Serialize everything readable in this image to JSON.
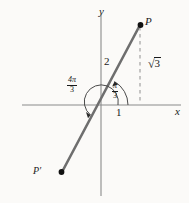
{
  "figure": {
    "background_color": "#fbfaf8",
    "ink_color": "#1a1a1a",
    "ray_color": "#6e6e6e",
    "axis_color": "#8a8a8a"
  },
  "axes": {
    "x_label": "x",
    "y_label": "y",
    "origin": {
      "x": 101,
      "y": 105
    }
  },
  "points": [
    {
      "name": "P",
      "label": "P",
      "x": 140,
      "y": 25
    },
    {
      "name": "P-prime",
      "label": "P′",
      "x": 62,
      "y": 172
    }
  ],
  "labels": {
    "radius": "2",
    "x_component": "1",
    "y_component_numerator": "3",
    "radical_sign": "√"
  },
  "angles": [
    {
      "name": "theta-minor",
      "numerator": "π",
      "denominator": "3",
      "value_text": "π/3"
    },
    {
      "name": "theta-major",
      "numerator": "4π",
      "denominator": "3",
      "value_text": "4π/3"
    }
  ],
  "geometry": {
    "dashed_line": {
      "x": 140,
      "y_top": 25,
      "y_bottom": 105
    },
    "ray_from": {
      "x": 101,
      "y": 105
    },
    "ray_to": {
      "x": 140,
      "y": 25
    },
    "ray_opposite_to": {
      "x": 62,
      "y": 172
    }
  }
}
